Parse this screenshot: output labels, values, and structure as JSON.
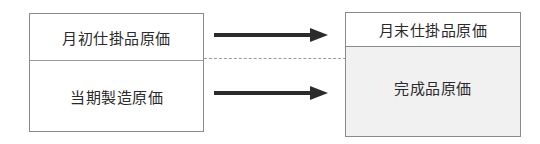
{
  "diagram": {
    "left_box": {
      "top_label": "月初仕掛品原価",
      "bottom_label": "当期製造原価"
    },
    "right_box": {
      "top_label": "月末仕掛品原価",
      "bottom_label": "完成品原価"
    },
    "arrows": [
      {
        "from": "月初仕掛品原価",
        "to": "月末仕掛品原価"
      },
      {
        "from": "当期製造原価",
        "to": "完成品原価"
      }
    ],
    "colors": {
      "arrow": "#2b2b2b",
      "border": "#8a8a8a",
      "shaded_fill": "#f1f1f1"
    }
  }
}
